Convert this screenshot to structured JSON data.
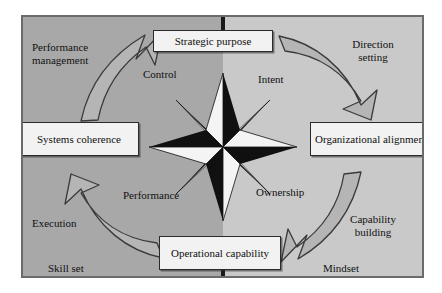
{
  "diagram": {
    "background_left": "#a8a8a8",
    "background_right": "#c9c9c9",
    "frame_border": "#6b6b6b",
    "arrow_fill": "#b5b5b5",
    "arrow_stroke": "#3a3a3a",
    "star_dark": "#101010",
    "star_light": "#f4f4f4",
    "node_fill": "#f2f2f2",
    "node_border": "#2a2a2a",
    "text_color": "#111111"
  },
  "nodes": {
    "strategic_purpose": "Strategic purpose",
    "systems_coherence": "Systems\ncoherence",
    "organizational_alignment": "Organizational\nalignment",
    "operational_capability": "Operational\ncapability"
  },
  "inner_labels": {
    "control": "Control",
    "intent": "Intent",
    "performance": "Performance",
    "ownership": "Ownership"
  },
  "outer_labels": {
    "performance_management": "Performance\nmanagement",
    "direction_setting": "Direction\nsetting",
    "execution": "Execution",
    "capability_building": "Capability\nbuilding",
    "skill_set": "Skill set",
    "mindset": "Mindset"
  },
  "arrows": [
    {
      "name": "arrow-top-left",
      "from": "Systems coherence",
      "to": "Strategic purpose",
      "direction": "clockwise-up-right"
    },
    {
      "name": "arrow-top-right",
      "from": "Strategic purpose",
      "to": "Organizational alignment",
      "direction": "clockwise-down-right"
    },
    {
      "name": "arrow-bottom-right",
      "from": "Organizational alignment",
      "to": "Operational capability",
      "direction": "clockwise-down-left"
    },
    {
      "name": "arrow-bottom-left",
      "from": "Operational capability",
      "to": "Systems coherence",
      "direction": "clockwise-up-left"
    }
  ],
  "compass": {
    "name": "compass-rose",
    "points": 8,
    "description": "Eight-pointed compass rose, each point split black/white"
  }
}
